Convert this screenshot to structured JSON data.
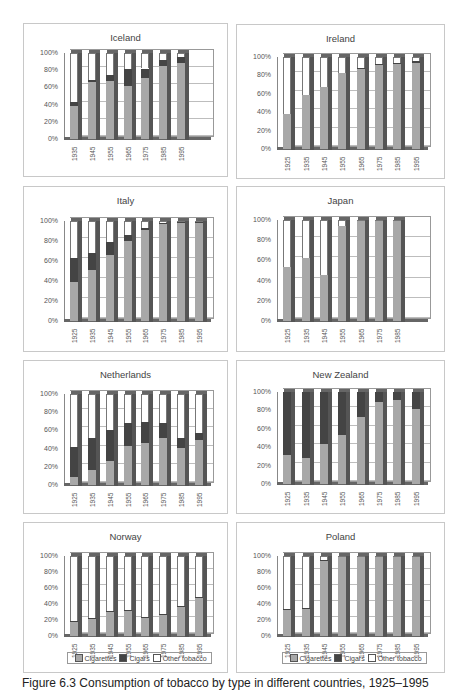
{
  "caption": "Figure 6.3 Consumption of tobacco by type in different countries, 1925–1995",
  "legend": {
    "items": [
      {
        "label": "Cigarettes",
        "color": "#a8a8a8"
      },
      {
        "label": "Cigars",
        "color": "#444444"
      },
      {
        "label": "Other tobacco",
        "color": "#ffffff"
      }
    ]
  },
  "y_ticks": [
    "100%",
    "80%",
    "60%",
    "40%",
    "20%",
    "0%"
  ],
  "chart_data": [
    {
      "type": "bar",
      "stacked": true,
      "title": "Iceland",
      "ylim": [
        0,
        100
      ],
      "yticks": [
        "0%",
        "20%",
        "40%",
        "60%",
        "80%",
        "100%"
      ],
      "categories": [
        "1935",
        "1945",
        "1955",
        "1965",
        "1975",
        "1985",
        "1995"
      ],
      "series": [
        {
          "name": "Cigarettes",
          "values": [
            38,
            66,
            68,
            62,
            71,
            85,
            88
          ]
        },
        {
          "name": "Cigars",
          "values": [
            5,
            3,
            7,
            19,
            11,
            7,
            7
          ]
        },
        {
          "name": "Other tobacco",
          "values": [
            57,
            31,
            25,
            19,
            18,
            8,
            5
          ]
        }
      ]
    },
    {
      "type": "bar",
      "stacked": true,
      "title": "Ireland",
      "ylim": [
        0,
        100
      ],
      "yticks": [
        "0%",
        "20%",
        "40%",
        "60%",
        "80%",
        "100%"
      ],
      "categories": [
        "1925",
        "1935",
        "1945",
        "1955",
        "1965",
        "1975",
        "1985",
        "1995"
      ],
      "series": [
        {
          "name": "Cigarettes",
          "values": [
            38,
            59,
            67,
            83,
            87,
            91,
            92,
            94
          ]
        },
        {
          "name": "Cigars",
          "values": [
            0,
            0,
            0,
            0,
            1,
            1,
            1,
            2
          ]
        },
        {
          "name": "Other tobacco",
          "values": [
            62,
            41,
            33,
            17,
            12,
            8,
            7,
            4
          ]
        }
      ]
    },
    {
      "type": "bar",
      "stacked": true,
      "title": "Italy",
      "ylim": [
        0,
        100
      ],
      "yticks": [
        "0%",
        "20%",
        "40%",
        "60%",
        "80%",
        "100%"
      ],
      "categories": [
        "1925",
        "1935",
        "1945",
        "1955",
        "1965",
        "1975",
        "1985",
        "1995"
      ],
      "series": [
        {
          "name": "Cigarettes",
          "values": [
            39,
            51,
            66,
            80,
            91,
            97,
            98,
            98
          ]
        },
        {
          "name": "Cigars",
          "values": [
            24,
            17,
            13,
            6,
            2,
            1,
            1,
            1
          ]
        },
        {
          "name": "Other tobacco",
          "values": [
            37,
            32,
            21,
            14,
            7,
            2,
            1,
            1
          ]
        }
      ]
    },
    {
      "type": "bar",
      "stacked": true,
      "title": "Japan",
      "ylim": [
        0,
        100
      ],
      "yticks": [
        "0%",
        "20%",
        "40%",
        "60%",
        "80%",
        "100%"
      ],
      "categories": [
        "1925",
        "1935",
        "1945",
        "1955",
        "1965",
        "1975",
        "1985"
      ],
      "series": [
        {
          "name": "Cigarettes",
          "values": [
            53,
            62,
            46,
            94,
            99,
            99,
            99
          ]
        },
        {
          "name": "Cigars",
          "values": [
            0,
            0,
            0,
            0,
            0,
            0,
            0
          ]
        },
        {
          "name": "Other tobacco",
          "values": [
            47,
            38,
            54,
            6,
            1,
            1,
            1
          ]
        }
      ]
    },
    {
      "type": "bar",
      "stacked": true,
      "title": "Netherlands",
      "ylim": [
        0,
        100
      ],
      "yticks": [
        "0%",
        "20%",
        "40%",
        "60%",
        "80%",
        "100%"
      ],
      "categories": [
        "1925",
        "1935",
        "1945",
        "1955",
        "1965",
        "1975",
        "1985",
        "1995"
      ],
      "series": [
        {
          "name": "Cigarettes",
          "values": [
            9,
            16,
            26,
            43,
            46,
            52,
            41,
            49
          ]
        },
        {
          "name": "Cigars",
          "values": [
            33,
            36,
            35,
            25,
            23,
            16,
            11,
            8
          ]
        },
        {
          "name": "Other tobacco",
          "values": [
            58,
            48,
            39,
            32,
            31,
            32,
            48,
            43
          ]
        }
      ]
    },
    {
      "type": "bar",
      "stacked": true,
      "title": "New Zealand",
      "ylim": [
        0,
        100
      ],
      "yticks": [
        "0%",
        "20%",
        "40%",
        "60%",
        "80%",
        "100%"
      ],
      "categories": [
        "1925",
        "1935",
        "1945",
        "1955",
        "1965",
        "1975",
        "1985",
        "1995"
      ],
      "series": [
        {
          "name": "Cigarettes",
          "values": [
            32,
            28,
            43,
            53,
            73,
            89,
            91,
            81
          ]
        },
        {
          "name": "Cigars",
          "values": [
            68,
            72,
            57,
            47,
            27,
            11,
            9,
            19
          ]
        },
        {
          "name": "Other tobacco",
          "values": [
            0,
            0,
            0,
            0,
            0,
            0,
            0,
            0
          ]
        }
      ]
    },
    {
      "type": "bar",
      "stacked": true,
      "title": "Norway",
      "ylim": [
        0,
        100
      ],
      "yticks": [
        "0%",
        "20%",
        "40%",
        "60%",
        "80%",
        "100%"
      ],
      "categories": [
        "1925",
        "1935",
        "1945",
        "1955",
        "1965",
        "1975",
        "1985",
        "1995"
      ],
      "series": [
        {
          "name": "Cigarettes",
          "values": [
            17,
            22,
            30,
            31,
            23,
            27,
            37,
            48
          ]
        },
        {
          "name": "Cigars",
          "values": [
            2,
            1,
            1,
            1,
            1,
            1,
            1,
            1
          ]
        },
        {
          "name": "Other tobacco",
          "values": [
            81,
            77,
            69,
            68,
            76,
            72,
            62,
            51
          ]
        }
      ],
      "legend": [
        "Cigarettes",
        "Cigars",
        "Other tobacco"
      ],
      "legend_position": "bottom"
    },
    {
      "type": "bar",
      "stacked": true,
      "title": "Poland",
      "ylim": [
        0,
        100
      ],
      "yticks": [
        "0%",
        "20%",
        "40%",
        "60%",
        "80%",
        "100%"
      ],
      "categories": [
        "1925",
        "1935",
        "1945",
        "1955",
        "1965",
        "1975",
        "1985",
        "1995"
      ],
      "series": [
        {
          "name": "Cigarettes",
          "values": [
            33,
            34,
            94,
            99,
            99,
            99,
            99,
            99
          ]
        },
        {
          "name": "Cigars",
          "values": [
            1,
            1,
            1,
            0,
            0,
            0,
            0,
            0
          ]
        },
        {
          "name": "Other tobacco",
          "values": [
            66,
            65,
            5,
            1,
            1,
            1,
            1,
            1
          ]
        }
      ],
      "legend": [
        "Cigarettes",
        "Cigars",
        "Other tobacco"
      ],
      "legend_position": "bottom"
    }
  ]
}
